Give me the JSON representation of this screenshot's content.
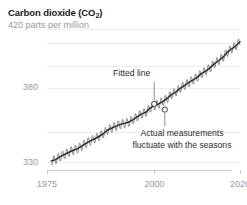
{
  "chart_data": {
    "type": "line",
    "title": "Carbon dioxide (CO2)",
    "title_main": "Carbon dioxide (CO",
    "title_sub": "2",
    "title_tail": ")",
    "subtitle": "420 parts per million",
    "xlabel": "",
    "ylabel": "",
    "xlim": [
      1975,
      2020
    ],
    "ylim": [
      325,
      422
    ],
    "xticks": [
      1975,
      2000,
      2020
    ],
    "xtick_labels": [
      "1975",
      "2000",
      "2020"
    ],
    "yticks": [
      330,
      380
    ],
    "ytick_labels": [
      "330",
      "380"
    ],
    "gridlines": [
      420,
      410,
      395,
      380,
      350,
      330
    ],
    "grid": true,
    "legend": "none",
    "series": [
      {
        "name": "Fitted line",
        "style": "solid-dark",
        "x": [
          1976.0,
          1977.0,
          1978.0,
          1979.0,
          1980.0,
          1981.0,
          1982.0,
          1983.0,
          1984.0,
          1985.0,
          1986.0,
          1987.0,
          1988.0,
          1989.0,
          1990.0,
          1991.0,
          1992.0,
          1993.0,
          1994.0,
          1995.0,
          1996.0,
          1997.0,
          1998.0,
          1999.0,
          2000.0,
          2001.0,
          2002.0,
          2003.0,
          2004.0,
          2005.0,
          2006.0,
          2007.0,
          2008.0,
          2009.0,
          2010.0,
          2011.0,
          2012.0,
          2013.0,
          2014.0,
          2015.0,
          2016.0,
          2017.0,
          2018.0,
          2019.0,
          2020.0
        ],
        "values": [
          331.1,
          332.0,
          333.8,
          335.4,
          336.8,
          338.1,
          339.2,
          340.9,
          342.8,
          344.4,
          345.9,
          347.4,
          349.2,
          351.6,
          353.1,
          354.4,
          355.6,
          356.4,
          357.1,
          358.8,
          360.8,
          362.6,
          363.8,
          366.6,
          368.3,
          369.5,
          371.1,
          373.2,
          375.8,
          377.5,
          379.8,
          381.9,
          383.8,
          385.6,
          387.4,
          389.9,
          391.6,
          393.8,
          396.5,
          398.6,
          400.8,
          404.2,
          406.5,
          408.5,
          411.4
        ]
      },
      {
        "name": "Actual measurements",
        "style": "thin-seasonal",
        "seasonal_amplitude": 3.0,
        "note": "monthly values oscillate +/- 3 ppm around the fitted line"
      }
    ],
    "annotations": [
      {
        "name": "fitted-line",
        "text": "Fitted line",
        "target_x": 2000.0,
        "target_y": 369.5
      },
      {
        "name": "actual-measurements",
        "text_line1": "Actual measurements",
        "text_line2": "fluctuate with the seasons",
        "target_x": 2002.0,
        "target_y": 367.0
      }
    ]
  },
  "colors": {
    "fitted_line": "#2b2b2b",
    "raw_line": "#5d5d5d",
    "grid": "#ededed",
    "axis": "#c9c9c9",
    "muted_text": "#9a9a9a",
    "body_text": "#2b2b2b",
    "title_text": "#1a1a1a",
    "background": "#ffffff"
  }
}
